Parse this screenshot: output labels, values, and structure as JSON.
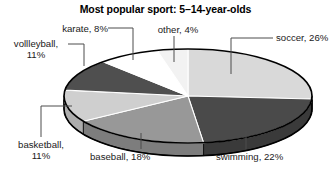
{
  "chart": {
    "title": "Most popular sport: 5–14-year-olds"
  },
  "chart_data": {
    "type": "pie",
    "title": "Most popular sport: 5–14-year-olds",
    "xlabel": "",
    "ylabel": "",
    "legend_position": "none",
    "grid": false,
    "style": "3d-exploded-none",
    "categories": [
      "soccer",
      "swimming",
      "baseball",
      "basketball",
      "volleyball",
      "karate",
      "other"
    ],
    "values": [
      26,
      22,
      18,
      11,
      11,
      8,
      4
    ],
    "units": "percent",
    "slices": [
      {
        "name": "soccer",
        "label": "soccer, 26%",
        "value": 26,
        "color": "#d9d9d9",
        "side_color": "#b8b8b8",
        "start_deg": 0,
        "end_deg": 93.6
      },
      {
        "name": "swimming",
        "label": "swimming, 22%",
        "value": 22,
        "color": "#4a4a4a",
        "side_color": "#3a3a3a",
        "start_deg": 93.6,
        "end_deg": 172.8
      },
      {
        "name": "baseball",
        "label": "baseball, 18%",
        "value": 18,
        "color": "#989898",
        "side_color": "#7d7d7d",
        "start_deg": 172.8,
        "end_deg": 237.6
      },
      {
        "name": "basketball",
        "label": "basketball, 11%",
        "value": 11,
        "color": "#cfcfcf",
        "side_color": "#adadad",
        "start_deg": 237.6,
        "end_deg": 277.2
      },
      {
        "name": "volleyball",
        "label": "vollleyball, 11%",
        "value": 11,
        "color": "#4f4f4f",
        "side_color": "#3f3f3f",
        "start_deg": 277.2,
        "end_deg": 316.8
      },
      {
        "name": "karate",
        "label": "karate, 8%",
        "value": 8,
        "color": "#ffffff",
        "side_color": "#dcdcdc",
        "start_deg": 316.8,
        "end_deg": 345.6
      },
      {
        "name": "other",
        "label": "other, 4%",
        "value": 4,
        "color": "#f2f2f2",
        "side_color": "#d2d2d2",
        "start_deg": 345.6,
        "end_deg": 360
      }
    ]
  },
  "labels": {
    "soccer": {
      "line1": "soccer, 26%",
      "line2": ""
    },
    "other": {
      "line1": "other, 4%",
      "line2": ""
    },
    "karate": {
      "line1": "karate, 8%",
      "line2": ""
    },
    "volleyball": {
      "line1": "vollleyball,",
      "line2": "11%"
    },
    "basketball": {
      "line1": "basketball,",
      "line2": "11%"
    },
    "baseball": {
      "line1": "baseball, 18%",
      "line2": ""
    },
    "swimming": {
      "line1": "swimming, 22%",
      "line2": ""
    }
  },
  "colors": {
    "background": "#ffffff",
    "text": "#1a1a1a",
    "outline": "#000000",
    "leader_line": "#4d4d4d"
  }
}
